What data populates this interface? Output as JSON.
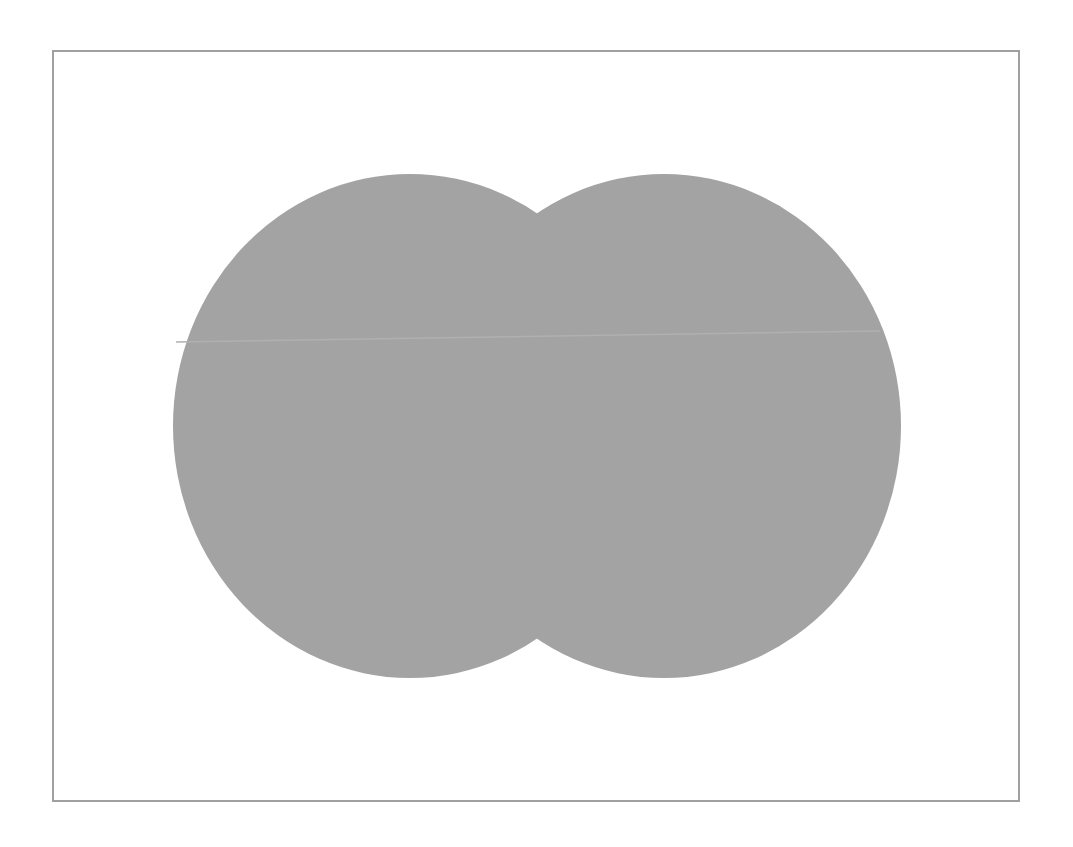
{
  "figure": {
    "frame": {
      "border_color": "#a0a0a0",
      "background": "#ffffff"
    },
    "shapes": [
      {
        "name": "left-circle",
        "cx": 410,
        "cy": 426,
        "rx": 237,
        "ry": 252,
        "fill": "#a3a3a3"
      },
      {
        "name": "right-circle",
        "cx": 664,
        "cy": 426,
        "rx": 237,
        "ry": 252,
        "fill": "#a3a3a3"
      }
    ],
    "seam_line": {
      "x1": 176,
      "y1": 342,
      "x2": 880,
      "y2": 331,
      "color": "#b0b0b0"
    }
  }
}
